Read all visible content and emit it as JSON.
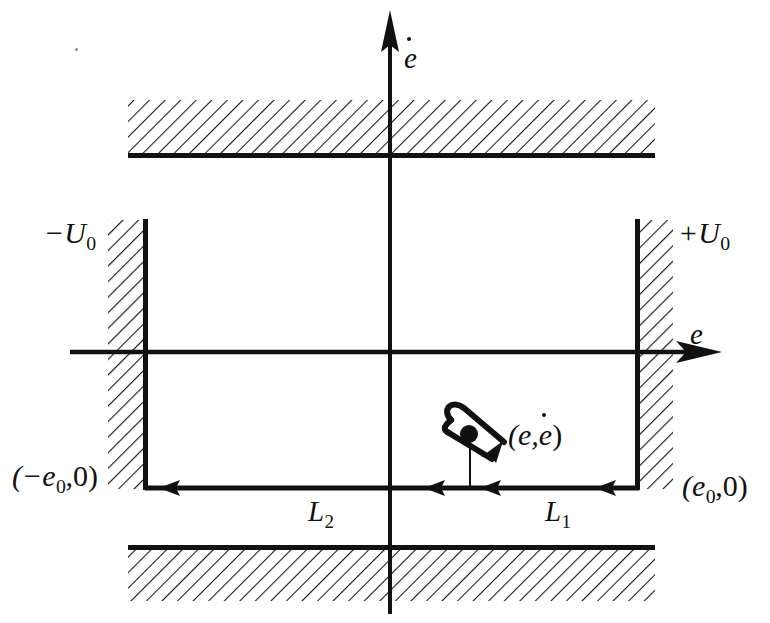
{
  "figure": {
    "kind": "phase-plane-sliding-mode-diagram",
    "background_color": "#ffffff",
    "ink_color": "#111111",
    "width": 770,
    "height": 623
  },
  "axes": {
    "horizontal": {
      "label": "e",
      "label_x": 690,
      "label_y": 320,
      "y": 352,
      "x_start": 70,
      "x_end": 718
    },
    "vertical": {
      "label_base": "e",
      "label_accent": "dot",
      "label_x": 404,
      "label_y": 44,
      "x": 390,
      "y_start": 12,
      "y_end": 614
    }
  },
  "walls": {
    "left": {
      "label_sign": "−",
      "label_base": "U",
      "label_sub": "0",
      "label_text": "−U",
      "label_x": 44,
      "label_y": 218,
      "line_x": 145,
      "y_top": 220,
      "y_bottom": 489,
      "hatch_from_x": 108,
      "hatch_to_x": 145,
      "hatch_side": "left"
    },
    "right": {
      "label_sign": "+",
      "label_base": "U",
      "label_sub": "0",
      "label_text": "+U",
      "label_x": 678,
      "label_y": 218,
      "line_x": 637,
      "y_top": 220,
      "y_bottom": 489,
      "hatch_from_x": 637,
      "hatch_to_x": 673,
      "hatch_side": "right"
    }
  },
  "bands": {
    "top": {
      "x_start": 128,
      "x_end": 655,
      "y_top": 100,
      "y_bottom": 155,
      "edge": "bottom"
    },
    "bottom": {
      "x_start": 128,
      "x_end": 655,
      "y_top": 547,
      "y_bottom": 601,
      "edge": "top"
    }
  },
  "switching_line": {
    "y": 488,
    "x_start": 145,
    "x_end": 637,
    "arrow_heads": [
      {
        "x": 172,
        "direction": "left"
      },
      {
        "x": 436,
        "direction": "left"
      },
      {
        "x": 492,
        "direction": "left"
      },
      {
        "x": 607,
        "direction": "left"
      }
    ]
  },
  "labels": {
    "left_point": {
      "text": "(−e",
      "sub": "0",
      "tail": ",0)",
      "x": 12,
      "y": 461
    },
    "right_point": {
      "text": "(e",
      "sub": "0",
      "tail": ",0)",
      "x": 682,
      "y": 471
    },
    "state_point": {
      "text": "(e,",
      "accent_base": "e",
      "tail": ")",
      "x": 508,
      "y": 420
    },
    "segment_left": {
      "text": "L",
      "sub": "2",
      "x": 308,
      "y": 497
    },
    "segment_right": {
      "text": "L",
      "sub": "1",
      "x": 545,
      "y": 497
    }
  },
  "state_marker": {
    "dot_x": 470,
    "dot_y": 435,
    "dot_radius": 8,
    "drop_line_to_y": 488,
    "loop_description": "curved hook arrow through state point"
  },
  "speckles": [
    {
      "x": 75,
      "y": 48
    }
  ]
}
